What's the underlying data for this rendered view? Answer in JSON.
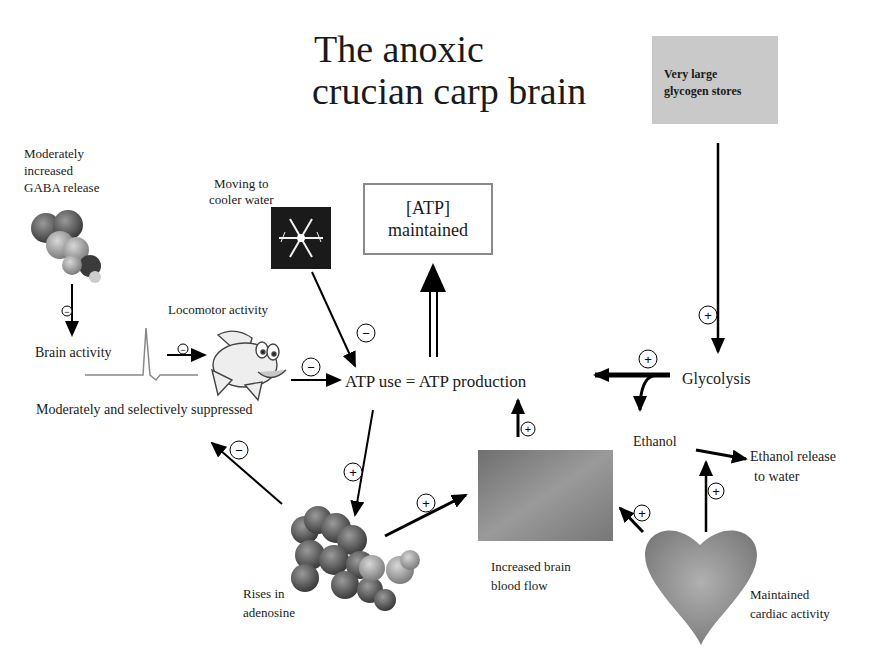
{
  "title": {
    "line1": "The anoxic",
    "line2": "crucian carp brain"
  },
  "glycogen_box": {
    "line1": "Very large",
    "line2": "glycogen stores"
  },
  "atp_box": {
    "line1": "[ATP]",
    "line2": "maintained"
  },
  "labels": {
    "gaba": [
      "Moderately",
      "increased",
      "GABA release"
    ],
    "cooler_water": [
      "Moving to",
      "cooler water"
    ],
    "locomotor": "Locomotor activity",
    "brain_activity": "Brain activity",
    "suppressed": "Moderately  and selectively suppressed",
    "atp_equation": "ATP use = ATP production",
    "glycolysis": "Glycolysis",
    "ethanol": "Ethanol",
    "ethanol_release": [
      "Ethanol release",
      "to water"
    ],
    "adenosine": [
      "Rises in",
      "adenosine"
    ],
    "blood_flow": [
      "Increased brain",
      "blood flow"
    ],
    "cardiac": [
      "Maintained",
      "cardiac activity"
    ]
  },
  "signs": {
    "plus": "+",
    "minus": "−"
  },
  "icons": [
    "gaba-molecule-icon",
    "snowflake-icon",
    "cartoon-fish-icon",
    "spike-trace-icon",
    "adenosine-molecule-icon",
    "blood-flow-image",
    "heart-icon"
  ]
}
